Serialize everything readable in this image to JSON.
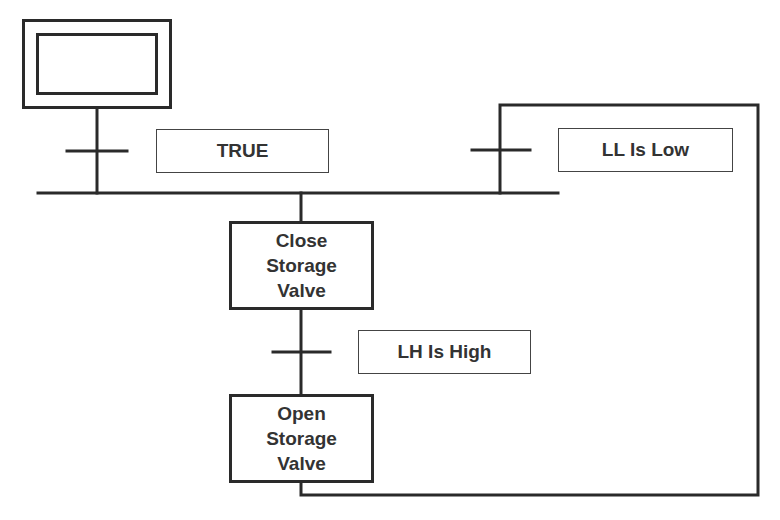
{
  "diagram": {
    "type": "sequential function chart",
    "steps": [
      {
        "id": "initial",
        "label": "",
        "kind": "initial-step"
      },
      {
        "id": "close",
        "label": "Close\nStorage\nValve"
      },
      {
        "id": "open",
        "label": "Open\nStorage\nValve"
      }
    ],
    "transitions": [
      {
        "id": "t1",
        "condition": "TRUE"
      },
      {
        "id": "t2",
        "condition": "LL Is Low"
      },
      {
        "id": "t3",
        "condition": "LH Is High"
      }
    ],
    "colors": {
      "line": "#2a2a2a",
      "background": "#ffffff",
      "text": "#333333"
    }
  }
}
